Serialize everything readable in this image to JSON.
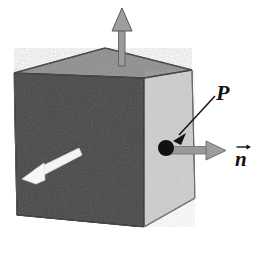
{
  "figure": {
    "background_color": "#ffffff",
    "width": 262,
    "height": 254
  },
  "labels": {
    "point_label": "P",
    "normal_label": "n",
    "normal_has_vector_arrow": true
  },
  "cube": {
    "name": "shaded-cube",
    "faces": {
      "front": {
        "name": "front-face",
        "fill_color": "#8b8b8b",
        "points": "14,73 144,78 144,227 17,215"
      },
      "top": {
        "name": "top-face",
        "fill_color": "#9c9c9c",
        "points": "14,73 105,48 192,70 144,78"
      },
      "right": {
        "name": "right-face",
        "fill_color": "#d3d3d3",
        "points": "144,78 192,70 195,198 144,227"
      }
    },
    "edge_color": "#4a4a4a"
  },
  "arrows": {
    "up": {
      "name": "up-arrow",
      "fill_color": "#9a9a9a",
      "stroke_color": "#5b5b5b",
      "from": [
        122,
        62
      ],
      "to": [
        122,
        9
      ]
    },
    "front_white": {
      "name": "front-face-white-arrow",
      "fill_color": "#f2f2f2",
      "stroke_color": "#d8d8d8",
      "from": [
        78,
        152
      ],
      "to": [
        23,
        178
      ]
    },
    "normal": {
      "name": "normal-vector-arrow",
      "fill_color": "#9a9a9a",
      "stroke_color": "#6a6a6a",
      "from": [
        168,
        150
      ],
      "to": [
        224,
        151
      ]
    }
  },
  "point": {
    "name": "point-P-dot",
    "fill_color": "#111111",
    "center": [
      166,
      148
    ],
    "radius": 8
  },
  "leader_line": {
    "name": "P-leader-line",
    "stroke_color": "#1a1a1a",
    "from": [
      215,
      97
    ],
    "to": [
      176,
      138
    ]
  }
}
